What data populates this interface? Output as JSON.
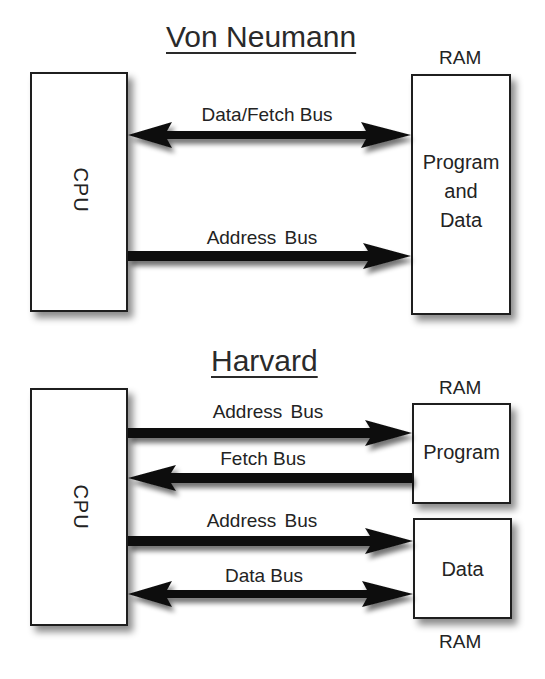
{
  "von_neumann": {
    "title": "Von Neumann",
    "cpu": {
      "label": "CPU"
    },
    "ram": {
      "caption": "RAM",
      "lines": [
        "Program",
        "and",
        "Data"
      ]
    },
    "buses": [
      {
        "label": "Data/Fetch Bus",
        "direction": "bidirectional",
        "from": "CPU",
        "to": "RAM"
      },
      {
        "label": "Address  Bus",
        "direction": "cpu-to-memory",
        "from": "CPU",
        "to": "RAM"
      }
    ]
  },
  "harvard": {
    "title": "Harvard",
    "cpu": {
      "label": "CPU"
    },
    "program_memory": {
      "caption": "RAM",
      "label": "Program"
    },
    "data_memory": {
      "caption": "RAM",
      "label": "Data"
    },
    "buses": [
      {
        "label": "Address  Bus",
        "direction": "cpu-to-memory",
        "from": "CPU",
        "to": "Program"
      },
      {
        "label": "Fetch Bus",
        "direction": "memory-to-cpu",
        "from": "Program",
        "to": "CPU"
      },
      {
        "label": "Address  Bus",
        "direction": "cpu-to-memory",
        "from": "CPU",
        "to": "Data"
      },
      {
        "label": "Data Bus",
        "direction": "bidirectional",
        "from": "CPU",
        "to": "Data"
      }
    ]
  },
  "colors": {
    "arrow": "#111111",
    "border": "#1e1e1e",
    "text": "#232323",
    "background": "#ffffff"
  }
}
